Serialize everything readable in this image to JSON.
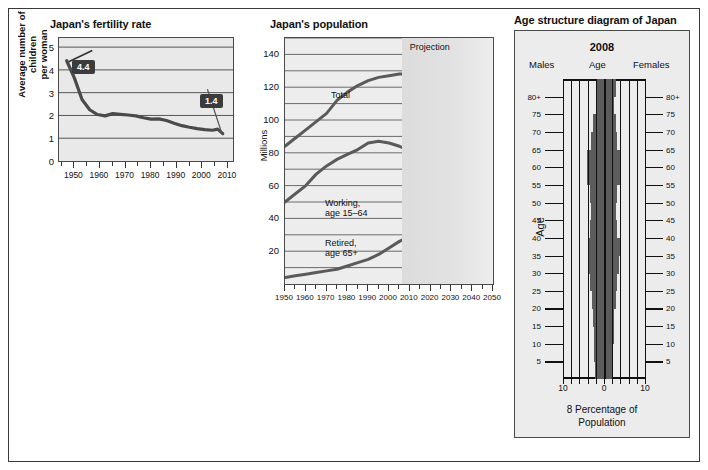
{
  "page": {
    "background": "#ffffff",
    "border_color": "#3a3a3a"
  },
  "fertility": {
    "title": "Japan's fertility rate",
    "y_axis_title": "Average number of children\nper woman",
    "callouts": [
      {
        "label": "4.4",
        "year": 1947,
        "value": 4.4
      },
      {
        "label": "1.4",
        "year": 2006,
        "value": 1.4
      }
    ],
    "chart_data": {
      "type": "line",
      "title": "Japan's fertility rate",
      "xlabel": "",
      "ylabel": "Average number of children per woman",
      "xlim": [
        1944,
        2012
      ],
      "ylim": [
        0,
        5.4
      ],
      "yticks": [
        0,
        1,
        2,
        3,
        4,
        5
      ],
      "xticks": [
        1950,
        1960,
        1970,
        1980,
        1990,
        2000,
        2010
      ],
      "minor_tick_step": 5,
      "grid": true,
      "series": [
        {
          "name": "Total fertility rate",
          "color": "#4a4a4a",
          "x": [
            1947,
            1950,
            1953,
            1956,
            1959,
            1962,
            1965,
            1968,
            1971,
            1974,
            1977,
            1980,
            1983,
            1986,
            1989,
            1992,
            1995,
            1998,
            2001,
            2004,
            2006,
            2008
          ],
          "y": [
            4.4,
            3.65,
            2.7,
            2.25,
            2.04,
            1.98,
            2.08,
            2.05,
            2.02,
            1.98,
            1.9,
            1.84,
            1.85,
            1.78,
            1.66,
            1.55,
            1.48,
            1.42,
            1.38,
            1.35,
            1.4,
            1.2
          ]
        }
      ]
    }
  },
  "population": {
    "title": "Japan's population",
    "y_axis_title": "Millions",
    "projection_label": "Projection",
    "projection_start_year": 2006,
    "series_labels": [
      {
        "text": "Total"
      },
      {
        "text": "Working,\nage 15–64"
      },
      {
        "text": "Retired,\nage 65+"
      }
    ],
    "chart_data": {
      "type": "line",
      "title": "Japan's population",
      "xlabel": "",
      "ylabel": "Millions",
      "xlim": [
        1950,
        2050
      ],
      "ylim": [
        0,
        150
      ],
      "yticks": [
        20,
        40,
        60,
        80,
        100,
        120,
        140
      ],
      "y_gridlines": [
        10,
        20,
        30,
        40,
        50,
        60,
        70,
        80,
        90,
        100,
        110,
        120,
        130,
        140,
        150
      ],
      "xticks": [
        1950,
        1960,
        1970,
        1980,
        1990,
        2000,
        2010,
        2020,
        2030,
        2040,
        2050
      ],
      "minor_tick_step": 5,
      "grid": true,
      "annotations": [
        {
          "text": "Projection",
          "x": 2015,
          "y": 147
        }
      ],
      "series": [
        {
          "name": "Total",
          "color": "#5a5a5a",
          "x": [
            1950,
            1955,
            1960,
            1965,
            1970,
            1975,
            1980,
            1985,
            1990,
            1995,
            2000,
            2005,
            2010,
            2015,
            2020,
            2025,
            2030,
            2035,
            2040,
            2045,
            2050
          ],
          "y": [
            84,
            89,
            94,
            99,
            104,
            112,
            117,
            121,
            124,
            126,
            127,
            128,
            128,
            126,
            124,
            121,
            117,
            113,
            109,
            105,
            101
          ]
        },
        {
          "name": "Working, age 15–64",
          "color": "#5a5a5a",
          "x": [
            1950,
            1955,
            1960,
            1965,
            1970,
            1975,
            1980,
            1985,
            1990,
            1995,
            2000,
            2005,
            2010,
            2015,
            2020,
            2025,
            2030,
            2035,
            2040,
            2045,
            2050
          ],
          "y": [
            50,
            55,
            60,
            67,
            72,
            76,
            79,
            82,
            86,
            87,
            86,
            84,
            81,
            76,
            73,
            71,
            67,
            64,
            60,
            58,
            55
          ]
        },
        {
          "name": "Retired, age 65+",
          "color": "#5a5a5a",
          "x": [
            1950,
            1955,
            1960,
            1965,
            1970,
            1975,
            1980,
            1985,
            1990,
            1995,
            2000,
            2005,
            2010,
            2015,
            2020,
            2025,
            2030,
            2035,
            2040,
            2045,
            2050
          ],
          "y": [
            4,
            5,
            6,
            7,
            8,
            9,
            11,
            13,
            15,
            18,
            22,
            26,
            29,
            33,
            35,
            34,
            34,
            34,
            35,
            35,
            35
          ]
        }
      ]
    }
  },
  "pyramid": {
    "title": "Age structure diagram of Japan",
    "year": "2008",
    "left_header": "Males",
    "center_header": "Age",
    "right_header": "Females",
    "age_axis_title": "Age",
    "caption": "8 Percentage of\nPopulation",
    "x_tick_labels": [
      "10",
      "0",
      "10"
    ],
    "chart_data": {
      "type": "bar",
      "title": "Age structure diagram of Japan, 2008",
      "xlabel": "8 Percentage of Population",
      "ylabel": "Age",
      "xlim": [
        -10,
        10
      ],
      "xticks": [
        -10,
        0,
        10
      ],
      "x_gridline_step": 2,
      "age_ticks": [
        "5",
        "10",
        "15",
        "20",
        "25",
        "30",
        "35",
        "40",
        "45",
        "50",
        "55",
        "60",
        "65",
        "70",
        "75",
        "80+"
      ],
      "bar_color": "#5c5c5c",
      "categories": [
        "0-4",
        "5-9",
        "10-14",
        "15-19",
        "20-24",
        "25-29",
        "30-34",
        "35-39",
        "40-44",
        "45-49",
        "50-54",
        "55-59",
        "60-64",
        "65-69",
        "70-74",
        "75-79",
        "80+"
      ],
      "series": [
        {
          "name": "Males",
          "values": [
            2.2,
            2.4,
            2.5,
            2.6,
            3.0,
            3.3,
            3.8,
            3.9,
            3.3,
            3.1,
            3.3,
            4.2,
            4.2,
            3.1,
            2.6,
            2.0,
            1.8
          ]
        },
        {
          "name": "Females",
          "values": [
            2.1,
            2.3,
            2.4,
            2.5,
            2.9,
            3.2,
            3.6,
            3.8,
            3.2,
            3.0,
            3.2,
            4.1,
            4.2,
            3.2,
            2.9,
            2.4,
            3.0
          ]
        }
      ]
    }
  }
}
